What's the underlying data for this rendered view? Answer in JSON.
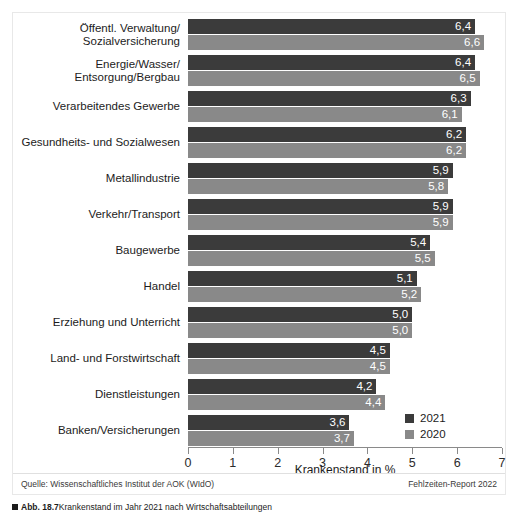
{
  "chart_data": {
    "type": "bar",
    "orientation": "horizontal",
    "title": "",
    "xlabel": "Krankenstand in %",
    "ylabel": "",
    "xlim": [
      0,
      7
    ],
    "xticks": [
      "0",
      "1",
      "2",
      "3",
      "4",
      "5",
      "6",
      "7"
    ],
    "grid": false,
    "legend_position": "bottom-right",
    "categories": [
      "Öffentl. Verwaltung/\nSozialversicherung",
      "Energie/Wasser/\nEntsorgung/Bergbau",
      "Verarbeitendes Gewerbe",
      "Gesundheits- und Sozialwesen",
      "Metallindustrie",
      "Verkehr/Transport",
      "Baugewerbe",
      "Handel",
      "Erziehung und Unterricht",
      "Land- und Forstwirtschaft",
      "Dienstleistungen",
      "Banken/Versicherungen"
    ],
    "series": [
      {
        "name": "2021",
        "color": "#3b3b3b",
        "values": [
          6.4,
          6.4,
          6.3,
          6.2,
          5.9,
          5.9,
          5.4,
          5.1,
          5.0,
          4.5,
          4.2,
          3.6
        ],
        "labels": [
          "6,4",
          "6,4",
          "6,3",
          "6,2",
          "5,9",
          "5,9",
          "5,4",
          "5,1",
          "5,0",
          "4,5",
          "4,2",
          "3,6"
        ]
      },
      {
        "name": "2020",
        "color": "#898989",
        "values": [
          6.6,
          6.5,
          6.1,
          6.2,
          5.8,
          5.9,
          5.5,
          5.2,
          5.0,
          4.5,
          4.4,
          3.7
        ],
        "labels": [
          "6,6",
          "6,5",
          "6,1",
          "6,2",
          "5,8",
          "5,9",
          "5,5",
          "5,2",
          "5,0",
          "4,5",
          "4,4",
          "3,7"
        ]
      }
    ]
  },
  "legend": {
    "entries": [
      {
        "label": "2021",
        "color": "#3b3b3b"
      },
      {
        "label": "2020",
        "color": "#898989"
      }
    ]
  },
  "footer": {
    "source": "Quelle: Wissenschaftliches Institut der AOK (WIdO)",
    "report": "Fehlzeiten-Report 2022"
  },
  "caption": {
    "mark": "",
    "label": "Abb. 18.7",
    "text": "Krankenstand im Jahr 2021 nach Wirtschaftsabteilungen"
  },
  "colors": {
    "series_2021": "#3b3b3b",
    "series_2020": "#898989",
    "axis": "#8a8a8a",
    "frame": "#e8e8e8",
    "text": "#1c1c1c",
    "value_text": "#ffffff"
  }
}
